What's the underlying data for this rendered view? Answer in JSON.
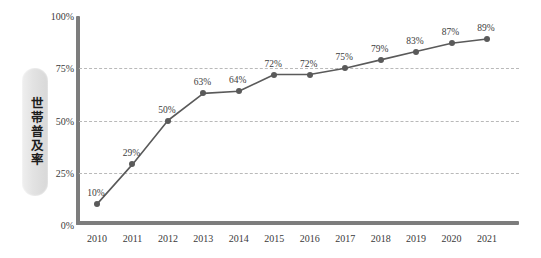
{
  "chart_data": {
    "type": "line",
    "title": "",
    "xlabel": "",
    "ylabel": "世帯普及率",
    "categories": [
      "2010",
      "2011",
      "2012",
      "2013",
      "2014",
      "2015",
      "2016",
      "2017",
      "2018",
      "2019",
      "2020",
      "2021"
    ],
    "values": [
      10,
      29,
      50,
      63,
      64,
      72,
      72,
      75,
      79,
      83,
      87,
      89
    ],
    "point_labels": [
      "10%",
      "29%",
      "50%",
      "63%",
      "64%",
      "72%",
      "72%",
      "75%",
      "79%",
      "83%",
      "87%",
      "89%"
    ],
    "ylim": [
      0,
      100
    ],
    "yticks": [
      0,
      25,
      50,
      75,
      100
    ],
    "ytick_labels": [
      "0%",
      "25%",
      "50%",
      "75%",
      "100%"
    ],
    "gridlines": [
      25,
      50,
      75
    ],
    "grid": true,
    "legend": "none",
    "series": [
      {
        "name": "世帯普及率",
        "values": [
          10,
          29,
          50,
          63,
          64,
          72,
          72,
          75,
          79,
          83,
          87,
          89
        ]
      }
    ],
    "colors": {
      "line": "#5a5a5a",
      "marker": "#5a5a5a",
      "axis": "#7d7d7d",
      "gridline": "#b9b9b9",
      "label_text": "#3c3c3c",
      "ylabel_pill": "#e2e2e2",
      "background": "#ffffff"
    }
  }
}
